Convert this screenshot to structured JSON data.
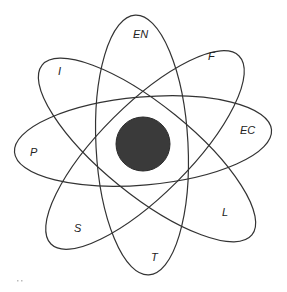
{
  "diagram": {
    "type": "flower-venn",
    "core": {
      "cx": 143,
      "cy": 144,
      "r": 27,
      "fill": "#3a3a3a"
    },
    "ellipses": [
      {
        "id": "en-t",
        "cx": 142,
        "cy": 145,
        "rx": 46,
        "ry": 130,
        "rotate": -3,
        "labels": [
          "EN",
          "T"
        ]
      },
      {
        "id": "p-ec",
        "cx": 143,
        "cy": 141,
        "rx": 129,
        "ry": 44,
        "rotate": -5,
        "labels": [
          "P",
          "EC"
        ]
      },
      {
        "id": "i-l",
        "cx": 147,
        "cy": 150,
        "rx": 135,
        "ry": 45,
        "rotate": 39,
        "labels": [
          "I",
          "L"
        ]
      },
      {
        "id": "f-s",
        "cx": 145,
        "cy": 150,
        "rx": 133,
        "ry": 45,
        "rotate": -45,
        "labels": [
          "F",
          "S"
        ]
      }
    ],
    "labels": [
      {
        "text": "EN",
        "x": 133,
        "y": 38
      },
      {
        "text": "F",
        "x": 208,
        "y": 60
      },
      {
        "text": "I",
        "x": 58,
        "y": 75
      },
      {
        "text": "EC",
        "x": 240,
        "y": 134
      },
      {
        "text": "P",
        "x": 30,
        "y": 156
      },
      {
        "text": "L",
        "x": 222,
        "y": 216
      },
      {
        "text": "S",
        "x": 74,
        "y": 232
      },
      {
        "text": "T",
        "x": 151,
        "y": 261
      }
    ],
    "colors": {
      "stroke": "#333333",
      "core_fill": "#3a3a3a",
      "background": "#ffffff"
    }
  }
}
